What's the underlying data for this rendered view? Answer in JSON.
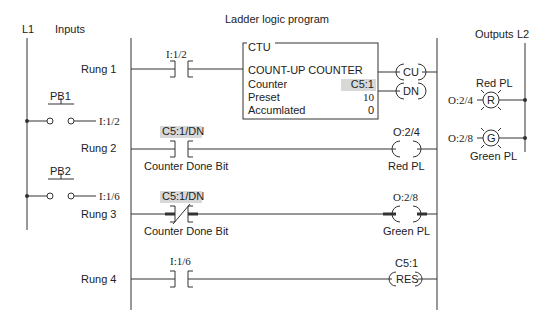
{
  "title": "Ladder logic program",
  "left_power": {
    "label": "L1",
    "section": "Inputs"
  },
  "right_power": {
    "label": "L2",
    "section": "Outputs"
  },
  "inputs": [
    {
      "name": "PB1",
      "address": "I:1/2"
    },
    {
      "name": "PB2",
      "address": "I:1/6"
    }
  ],
  "outputs": [
    {
      "name": "Red PL",
      "address": "O:2/4",
      "letter": "R"
    },
    {
      "name": "Green PL",
      "address": "O:2/8",
      "letter": "G"
    }
  ],
  "rungs": [
    {
      "label": "Rung 1",
      "contact": {
        "address": "I:1/2",
        "type": "NO"
      }
    },
    {
      "label": "Rung 2",
      "contact": {
        "address": "C5:1/DN",
        "type": "NO",
        "desc": "Counter Done Bit"
      },
      "coil": {
        "address": "O:2/4",
        "desc": "Red PL"
      }
    },
    {
      "label": "Rung 3",
      "contact": {
        "address": "C5:1/DN",
        "type": "NC",
        "desc": "Counter Done Bit"
      },
      "coil": {
        "address": "O:2/8",
        "desc": "Green PL"
      }
    },
    {
      "label": "Rung 4",
      "contact": {
        "address": "I:1/6",
        "type": "NO"
      },
      "coil": {
        "address": "C5:1",
        "text": "RES"
      }
    }
  ],
  "counter": {
    "tag": "CTU",
    "title": "COUNT-UP COUNTER",
    "rows": [
      {
        "label": "Counter",
        "value": "C5:1"
      },
      {
        "label": "Preset",
        "value": "10"
      },
      {
        "label": "Accumlated",
        "value": "0"
      }
    ],
    "outputs": [
      "CU",
      "DN"
    ]
  }
}
